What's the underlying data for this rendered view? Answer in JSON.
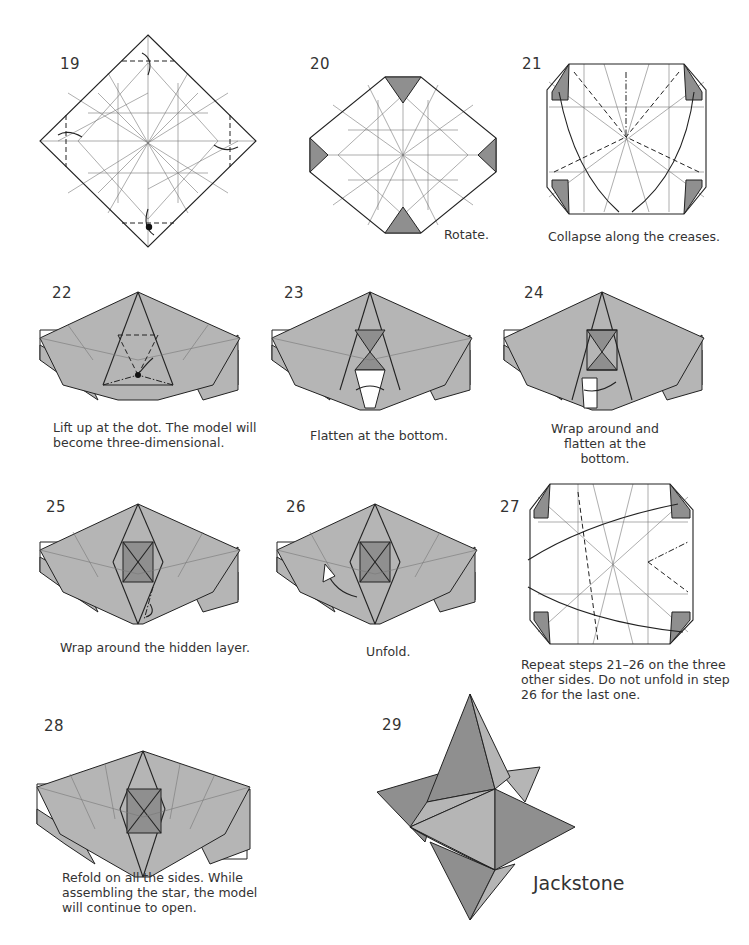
{
  "page": {
    "title": "Jackstone"
  },
  "colors": {
    "paper": "#ffffff",
    "model_gray": "#b5b5b5",
    "model_dark_gray": "#8f8f8f",
    "line": "#222222"
  },
  "steps": [
    {
      "number": "19",
      "caption": ""
    },
    {
      "number": "20",
      "caption": "Rotate."
    },
    {
      "number": "21",
      "caption": "Collapse along the creases."
    },
    {
      "number": "22",
      "caption": "Lift up at the dot. The model will become three-dimensional."
    },
    {
      "number": "23",
      "caption": "Flatten at the bottom."
    },
    {
      "number": "24",
      "caption": "Wrap around and flatten at the bottom."
    },
    {
      "number": "25",
      "caption": "Wrap around the hidden layer."
    },
    {
      "number": "26",
      "caption": "Unfold."
    },
    {
      "number": "27",
      "caption": "Repeat steps 21–26 on the three other sides. Do not unfold in step 26 for the last one."
    },
    {
      "number": "28",
      "caption": "Refold on all the sides. While assembling the star, the model will continue to open."
    },
    {
      "number": "29",
      "caption": ""
    }
  ]
}
